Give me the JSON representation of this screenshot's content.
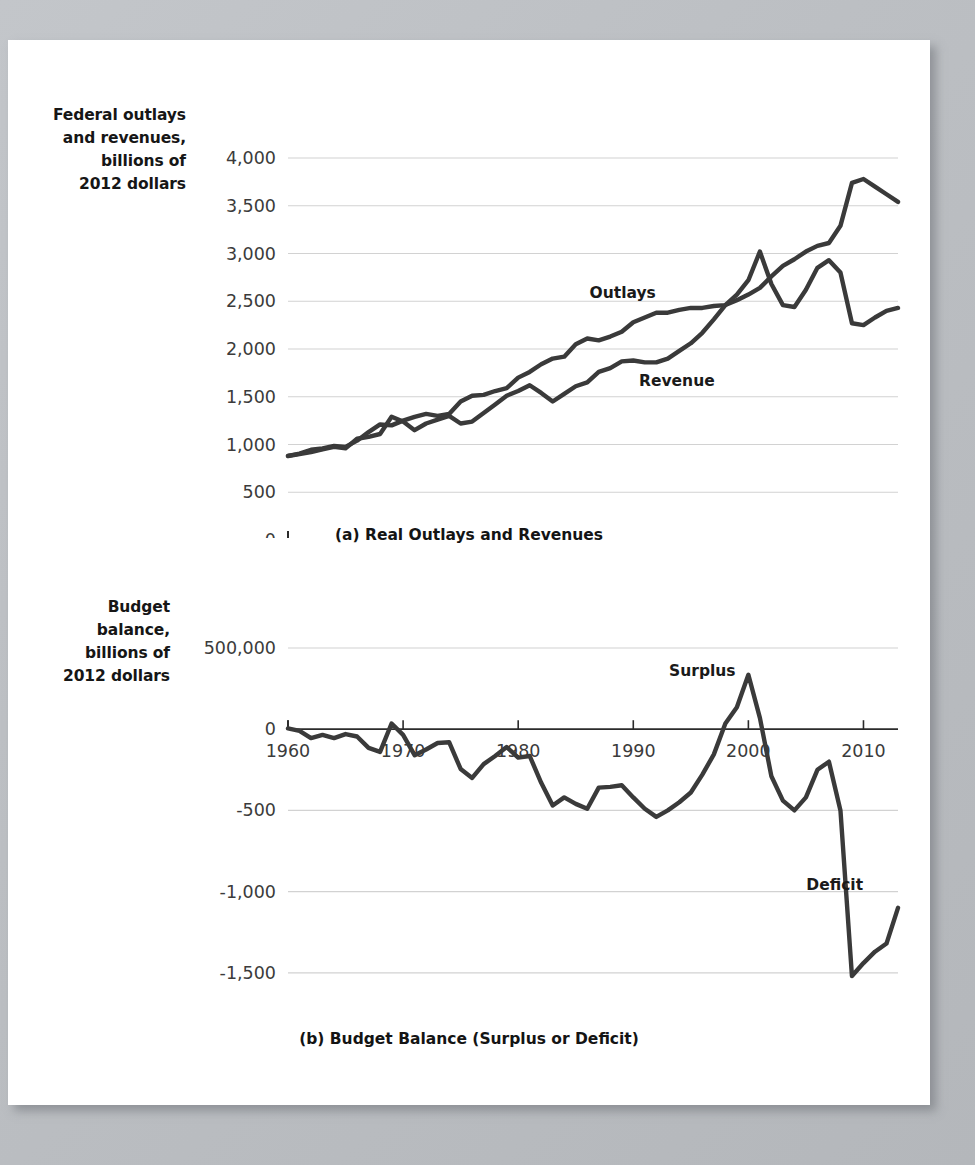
{
  "figure": {
    "background_color": "#bcbfc3",
    "card_color": "#ffffff",
    "line_color": "#3a3a3a",
    "grid_color": "#d2d2d2",
    "axis_color": "#2b2b2b"
  },
  "panel_a": {
    "axis_title": "Federal outlays and revenues, billions of 2012 dollars",
    "axis_title_lines": [
      "Federal outlays",
      "and revenues,",
      "billions of",
      "2012 dollars"
    ],
    "caption": "(a) Real Outlays and Revenues",
    "series_labels": {
      "outlays": "Outlays",
      "revenue": "Revenue"
    }
  },
  "panel_b": {
    "axis_title": "Budget balance, billions of 2012 dollars",
    "axis_title_lines": [
      "Budget",
      "balance,",
      "billions of",
      "2012 dollars"
    ],
    "caption": "(b) Budget Balance (Surplus or Deficit)",
    "series_labels": {
      "surplus": "Surplus",
      "deficit": "Deficit"
    }
  },
  "chart_data": [
    {
      "type": "line",
      "title": "(a) Real Outlays and Revenues",
      "xlabel": "",
      "ylabel": "Federal outlays and revenues, billions of 2012 dollars",
      "xlim": [
        1960,
        2013
      ],
      "ylim": [
        0,
        4000
      ],
      "ytick_labels": [
        "0",
        "500",
        "1,000",
        "1,500",
        "2,000",
        "2,500",
        "3,000",
        "3,500",
        "4,000"
      ],
      "yticks": [
        0,
        500,
        1000,
        1500,
        2000,
        2500,
        3000,
        3500,
        4000
      ],
      "xtick_labels": [
        "1960",
        "1970",
        "1980",
        "1990",
        "2000",
        "2010"
      ],
      "xticks": [
        1960,
        1970,
        1980,
        1990,
        2000,
        2010
      ],
      "grid": true,
      "legend_position": "inline-annotation",
      "x": [
        1960,
        1961,
        1962,
        1963,
        1964,
        1965,
        1966,
        1967,
        1968,
        1969,
        1970,
        1971,
        1972,
        1973,
        1974,
        1975,
        1976,
        1977,
        1978,
        1979,
        1980,
        1981,
        1982,
        1983,
        1984,
        1985,
        1986,
        1987,
        1988,
        1989,
        1990,
        1991,
        1992,
        1993,
        1994,
        1995,
        1996,
        1997,
        1998,
        1999,
        2000,
        2001,
        2002,
        2003,
        2004,
        2005,
        2006,
        2007,
        2008,
        2009,
        2010,
        2011,
        2012,
        2013
      ],
      "series": [
        {
          "name": "Outlays",
          "values": [
            880,
            905,
            945,
            960,
            985,
            975,
            1040,
            1130,
            1210,
            1200,
            1250,
            1290,
            1320,
            1300,
            1320,
            1450,
            1510,
            1520,
            1560,
            1590,
            1700,
            1760,
            1840,
            1900,
            1920,
            2050,
            2110,
            2090,
            2130,
            2180,
            2280,
            2330,
            2380,
            2380,
            2410,
            2430,
            2430,
            2450,
            2460,
            2510,
            2570,
            2640,
            2760,
            2870,
            2940,
            3020,
            3080,
            3110,
            3290,
            3740,
            3780,
            3700,
            3620,
            3540
          ]
        },
        {
          "name": "Revenue",
          "values": [
            880,
            900,
            920,
            950,
            975,
            960,
            1060,
            1080,
            1110,
            1290,
            1240,
            1150,
            1220,
            1260,
            1300,
            1220,
            1240,
            1330,
            1420,
            1510,
            1560,
            1620,
            1540,
            1450,
            1530,
            1610,
            1650,
            1760,
            1800,
            1870,
            1880,
            1860,
            1860,
            1900,
            1980,
            2060,
            2170,
            2310,
            2460,
            2570,
            2720,
            3020,
            2680,
            2460,
            2440,
            2620,
            2850,
            2930,
            2800,
            2270,
            2250,
            2330,
            2400,
            2430
          ]
        }
      ]
    },
    {
      "type": "line",
      "title": "(b) Budget Balance (Surplus or Deficit)",
      "xlabel": "",
      "ylabel": "Budget balance, billions of 2012 dollars",
      "xlim": [
        1960,
        2013
      ],
      "ylim": [
        -2000,
        500
      ],
      "ytick_labels": [
        "500,000",
        "0",
        "-500",
        "-1,000",
        "-1,500",
        "-2,000"
      ],
      "yticks": [
        500,
        0,
        -500,
        -1000,
        -1500,
        -2000
      ],
      "xtick_labels": [
        "1960",
        "1970",
        "1980",
        "1990",
        "2000",
        "2010"
      ],
      "xticks": [
        1960,
        1970,
        1980,
        1990,
        2000,
        2010
      ],
      "grid": true,
      "annotations": [
        {
          "text": "Surplus",
          "x": 1996,
          "y": 330
        },
        {
          "text": "Deficit",
          "x": 2007.5,
          "y": -990
        }
      ],
      "x": [
        1960,
        1961,
        1962,
        1963,
        1964,
        1965,
        1966,
        1967,
        1968,
        1969,
        1970,
        1971,
        1972,
        1973,
        1974,
        1975,
        1976,
        1977,
        1978,
        1979,
        1980,
        1981,
        1982,
        1983,
        1984,
        1985,
        1986,
        1987,
        1988,
        1989,
        1990,
        1991,
        1992,
        1993,
        1994,
        1995,
        1996,
        1997,
        1998,
        1999,
        2000,
        2001,
        2002,
        2003,
        2004,
        2005,
        2006,
        2007,
        2008,
        2009,
        2010,
        2011,
        2012,
        2013
      ],
      "series": [
        {
          "name": "Budget balance",
          "values": [
            5,
            -10,
            -55,
            -35,
            -55,
            -30,
            -45,
            -115,
            -140,
            35,
            -35,
            -160,
            -125,
            -85,
            -80,
            -245,
            -300,
            -215,
            -165,
            -110,
            -175,
            -165,
            -330,
            -470,
            -420,
            -460,
            -490,
            -360,
            -355,
            -345,
            -420,
            -490,
            -540,
            -500,
            -450,
            -390,
            -280,
            -155,
            35,
            135,
            335,
            70,
            -290,
            -440,
            -500,
            -420,
            -250,
            -200,
            -500,
            -1520,
            -1440,
            -1370,
            -1320,
            -1100
          ]
        }
      ]
    }
  ]
}
